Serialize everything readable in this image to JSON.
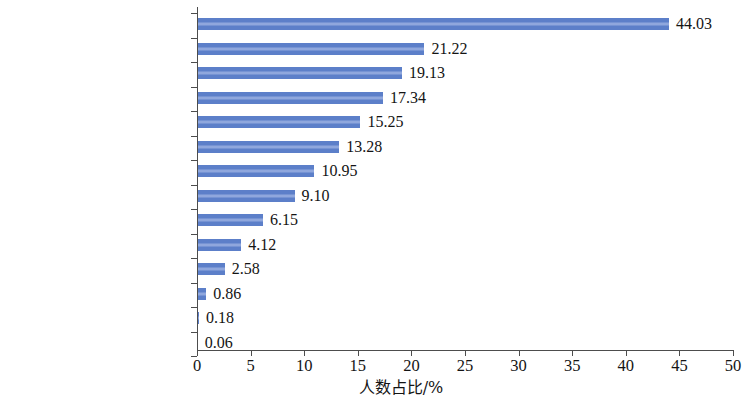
{
  "chart_data": {
    "type": "bar",
    "orientation": "horizontal",
    "title": "",
    "subtitle": "",
    "xlabel": "人数占比/%",
    "ylabel": "",
    "xlim": [
      0,
      50
    ],
    "xticks": [
      "0",
      "5",
      "10",
      "15",
      "20",
      "25",
      "30",
      "35",
      "40",
      "45",
      "50"
    ],
    "xtick_values": [
      0,
      5,
      10,
      15,
      20,
      25,
      30,
      35,
      40,
      45,
      50
    ],
    "grid": false,
    "legend": false,
    "legend_position": "none",
    "bar_color": "#5C7FC9",
    "axis_color": "#4D4D4D",
    "categories": [
      "生产运行/工程应用",
      "应用/开发研究",
      "设计",
      "一般行政管理",
      "基础研究",
      "科技管理",
      "技术推广",
      "研究辅助/技术辅助",
      "其他",
      "科学普及",
      "教学",
      "中介服务",
      "社科研究",
      "临床"
    ],
    "values": [
      44.03,
      21.22,
      19.13,
      17.34,
      15.25,
      13.28,
      10.95,
      9.1,
      6.15,
      4.12,
      2.58,
      0.86,
      0.18,
      0.06
    ],
    "value_labels": [
      "44.03",
      "21.22",
      "19.13",
      "17.34",
      "15.25",
      "13.28",
      "10.95",
      "9.10",
      "6.15",
      "4.12",
      "2.58",
      "0.86",
      "0.18",
      "0.06"
    ]
  }
}
